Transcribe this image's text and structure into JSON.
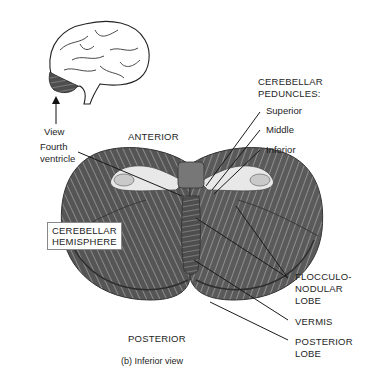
{
  "figure": {
    "caption": "(b) Inferior view",
    "orientation": {
      "anterior": "ANTERIOR",
      "posterior": "POSTERIOR"
    },
    "inset": {
      "label": "View",
      "icon": "brain-lateral-icon"
    },
    "labels": {
      "fourth_ventricle_line1": "Fourth",
      "fourth_ventricle_line2": "ventricle",
      "peduncles_title_line1": "CEREBELLAR",
      "peduncles_title_line2": "PEDUNCLES:",
      "superior": "Superior",
      "middle": "Middle",
      "inferior": "Inferior",
      "hemisphere_line1": "CEREBELLAR",
      "hemisphere_line2": "HEMISPHERE",
      "flocculo_line1": "FLOCCULO-",
      "flocculo_line2": "NODULAR",
      "flocculo_line3": "LOBE",
      "vermis": "VERMIS",
      "posterior_lobe_line1": "POSTERIOR",
      "posterior_lobe_line2": "LOBE"
    },
    "colors": {
      "tissue_dark": "#3c3c3c",
      "tissue_mid": "#6a6a6a",
      "tissue_light": "#9a9a9a",
      "peduncle_light": "#e6e6e6",
      "leader_line": "#1a1a1a"
    }
  }
}
